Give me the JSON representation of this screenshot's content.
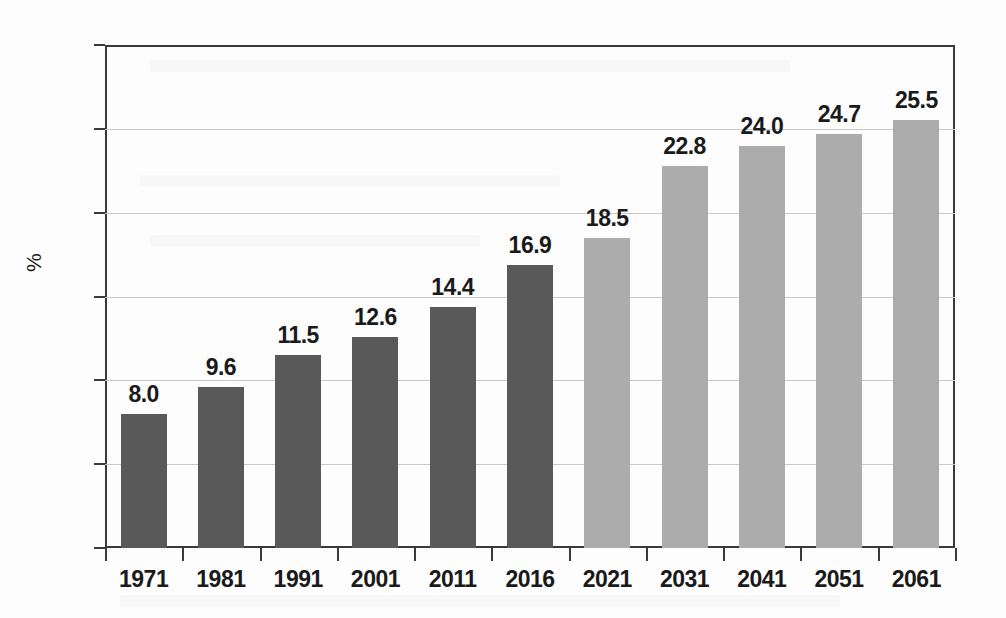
{
  "chart_data": {
    "type": "bar",
    "title": "",
    "xlabel": "",
    "ylabel": "%",
    "ylim": [
      0,
      30
    ],
    "ytick_step": 5,
    "yticks": [
      "0",
      "5",
      "10",
      "15",
      "20",
      "25",
      "30"
    ],
    "grid": true,
    "legend": "none",
    "categories": [
      "1971",
      "1981",
      "1991",
      "2001",
      "2011",
      "2016",
      "2021",
      "2031",
      "2041",
      "2051",
      "2061"
    ],
    "values": [
      8.0,
      9.6,
      11.5,
      12.6,
      14.4,
      16.9,
      18.5,
      22.8,
      24.0,
      24.7,
      25.5
    ],
    "labels": [
      "8.0",
      "9.6",
      "11.5",
      "12.6",
      "14.4",
      "16.9",
      "18.5",
      "22.8",
      "24.0",
      "24.7",
      "25.5"
    ],
    "series_groups": [
      {
        "name": "historical",
        "categories": [
          "1971",
          "1981",
          "1991",
          "2001",
          "2011",
          "2016"
        ],
        "color": "#595959"
      },
      {
        "name": "projected",
        "categories": [
          "2021",
          "2031",
          "2041",
          "2051",
          "2061"
        ],
        "color": "#acacac"
      }
    ],
    "bar_colors": [
      "#595959",
      "#595959",
      "#595959",
      "#595959",
      "#595959",
      "#595959",
      "#acacac",
      "#acacac",
      "#acacac",
      "#acacac",
      "#acacac"
    ],
    "axis_color": "#3a3a3a",
    "gridline_color": "#c9c9c9",
    "background": "#fdfdfd"
  },
  "caption": {
    "text": ""
  }
}
